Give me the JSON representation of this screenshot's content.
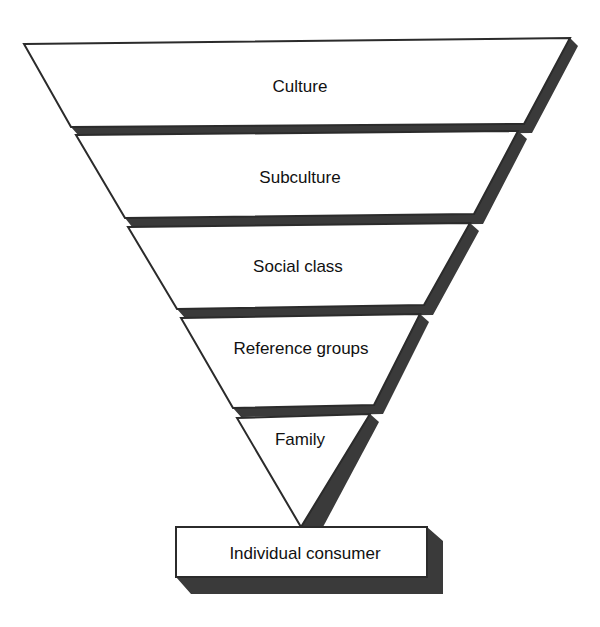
{
  "diagram": {
    "type": "inverted-pyramid",
    "colors": {
      "background": "#ffffff",
      "face": "#ffffff",
      "outline": "#2b2b2b",
      "shadow": "#3a3a3a",
      "text": "#111111"
    },
    "layers": [
      {
        "label": "Culture"
      },
      {
        "label": "Subculture"
      },
      {
        "label": "Social class"
      },
      {
        "label": "Reference groups"
      },
      {
        "label": "Family"
      }
    ],
    "base": {
      "label": "Individual consumer"
    }
  }
}
